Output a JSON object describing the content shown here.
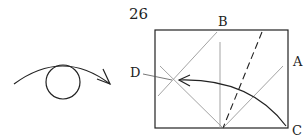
{
  "step_number": "26",
  "symbol": {
    "name": "turn-over-symbol",
    "description": "Turn the model over"
  },
  "labels": {
    "A": "A",
    "B": "B",
    "C": "C",
    "D": "D"
  },
  "colors": {
    "line": "#222222",
    "crease": "#999999"
  }
}
